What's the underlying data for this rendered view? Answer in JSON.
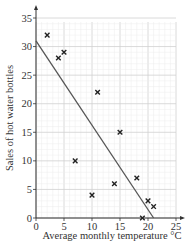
{
  "chart_data": {
    "type": "scatter",
    "title": "",
    "xlabel": "Average monthly temperature °C",
    "ylabel": "Sales of hot water bottles",
    "xlim": [
      0,
      25
    ],
    "ylim": [
      0,
      35
    ],
    "xticks": [
      0,
      5,
      10,
      15,
      20,
      25
    ],
    "yticks": [
      0,
      5,
      10,
      15,
      20,
      25,
      30,
      35
    ],
    "grid": true,
    "marker": "x",
    "points": [
      {
        "x": 2,
        "y": 32
      },
      {
        "x": 4,
        "y": 28
      },
      {
        "x": 5,
        "y": 29
      },
      {
        "x": 7,
        "y": 10
      },
      {
        "x": 10,
        "y": 4
      },
      {
        "x": 11,
        "y": 22
      },
      {
        "x": 14,
        "y": 6
      },
      {
        "x": 15,
        "y": 15
      },
      {
        "x": 18,
        "y": 7
      },
      {
        "x": 19,
        "y": 0
      },
      {
        "x": 20,
        "y": 3
      },
      {
        "x": 21,
        "y": 2
      }
    ],
    "line_of_best_fit": {
      "x1": 0,
      "y1": 31,
      "x2": 21,
      "y2": 0
    },
    "colors": {
      "grid_major": "#d0d0d0",
      "grid_minor": "#ececec",
      "axis": "#333333",
      "line": "#555555",
      "marker": "#222222"
    }
  }
}
